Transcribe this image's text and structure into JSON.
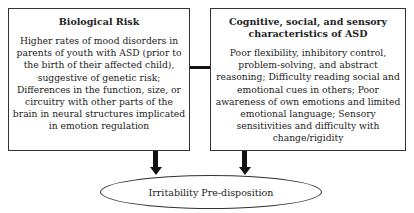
{
  "left_box": {
    "title": "Biological Risk",
    "body": "Higher rates of mood disorders in parents of youth with ASD (prior to the birth of their affected child), suggestive of genetic risk; Differences in the function, size, or circuitry with other parts of the brain in neural structures implicated in emotion regulation"
  },
  "right_box": {
    "title": "Cognitive, social, and sensory characteristics of ASD",
    "body": "Poor flexibility, inhibitory control, problem-solving, and abstract reasoning; Difficulty reading social and emotional cues in others; Poor awareness of own emotions and limited emotional language; Sensory sensitivities and difficulty with change/rigidity"
  },
  "outcome": {
    "label": "Irritability Pre-disposition"
  }
}
